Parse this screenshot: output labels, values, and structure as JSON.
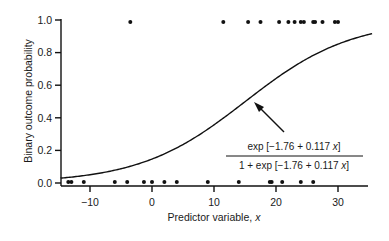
{
  "chart_data": {
    "type": "scatter",
    "title": "",
    "xlabel": "Predictor variable, x",
    "xlabel_main": "Predictor variable, ",
    "xlabel_var": "x",
    "ylabel": "Binary outcome probability",
    "xlim": [
      -15,
      35
    ],
    "ylim": [
      0,
      1
    ],
    "grid": false,
    "legend": null,
    "x_ticks": [
      -10,
      0,
      10,
      20,
      30
    ],
    "x_tick_labels": [
      "−10",
      "0",
      "10",
      "20",
      "30"
    ],
    "y_ticks": [
      0.0,
      0.2,
      0.4,
      0.6,
      0.8,
      1.0
    ],
    "y_tick_labels": [
      "0.0",
      "0.2",
      "0.4",
      "0.6",
      "0.8",
      "1.0"
    ],
    "series": [
      {
        "name": "Observed outcome = 1",
        "type": "scatter",
        "x": [
          -3.5,
          11.5,
          15.5,
          17.5,
          20.5,
          22,
          23,
          24,
          24.5,
          26,
          26.3,
          27.5,
          29.5,
          30
        ],
        "y": [
          1,
          1,
          1,
          1,
          1,
          1,
          1,
          1,
          1,
          1,
          1,
          1,
          1,
          1
        ]
      },
      {
        "name": "Observed outcome = 0",
        "type": "scatter",
        "x": [
          -13.5,
          -13,
          -11,
          -6,
          -4,
          -1.3,
          0,
          2,
          4,
          9,
          14,
          19,
          19.3,
          21,
          24,
          26
        ],
        "y": [
          0,
          0,
          0,
          0,
          0,
          0,
          0,
          0,
          0,
          0,
          0,
          0,
          0,
          0,
          0,
          0
        ]
      },
      {
        "name": "Fitted logistic curve",
        "type": "line",
        "intercept": -1.76,
        "slope": 0.117,
        "x_range": [
          -15,
          35.5
        ]
      }
    ],
    "annotations": [
      {
        "type": "arrow",
        "text_numerator": "exp [−1.76 + 0.117 x]",
        "text_denominator": "1 + exp [−1.76 + 0.117 x]",
        "points_to": [
          16.7,
          0.49
        ]
      }
    ]
  },
  "formula": {
    "num_prefix": "exp [−1.76 + 0.117 ",
    "den_prefix": "1 + exp [−1.76 + 0.117 ",
    "var": "x",
    "suffix": "]"
  }
}
